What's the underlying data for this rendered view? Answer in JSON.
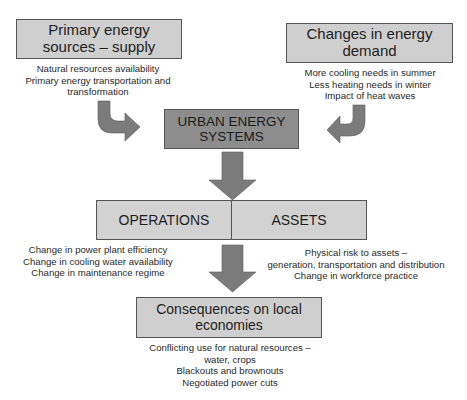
{
  "diagram": {
    "supply": {
      "title": "Primary energy sources – supply",
      "title_lines": [
        "Primary energy",
        "sources – supply"
      ],
      "notes": [
        "Natural resources availability",
        "Primary energy transportation and",
        "transformation"
      ]
    },
    "demand": {
      "title": "Changes in energy demand",
      "title_lines": [
        "Changes in energy",
        "demand"
      ],
      "notes": [
        "More cooling needs in summer",
        "Less heating needs in winter",
        "Impact of heat waves"
      ]
    },
    "core": {
      "title": "URBAN ENERGY SYSTEMS",
      "title_lines": [
        "URBAN ENERGY",
        "SYSTEMS"
      ]
    },
    "operations": {
      "label": "OPERATIONS",
      "notes": [
        "Change in power plant efficiency",
        "Change in cooling water availability",
        "Change in maintenance regime"
      ]
    },
    "assets": {
      "label": "ASSETS",
      "notes": [
        "Physical risk to assets –",
        "generation, transportation and distribution",
        "Change in workforce practice"
      ]
    },
    "consequences": {
      "title": "Consequences on local economies",
      "title_lines": [
        "Consequences on local",
        "economies"
      ],
      "notes": [
        "Conflicting use for natural resources –",
        "water, crops",
        "Blackouts and brownouts",
        "Negotiated power cuts"
      ]
    },
    "colors": {
      "light_box": "#cfcfcf",
      "dark_box": "#8d8d8d",
      "arrow": "#7b7b7b",
      "border": "#555555"
    }
  }
}
